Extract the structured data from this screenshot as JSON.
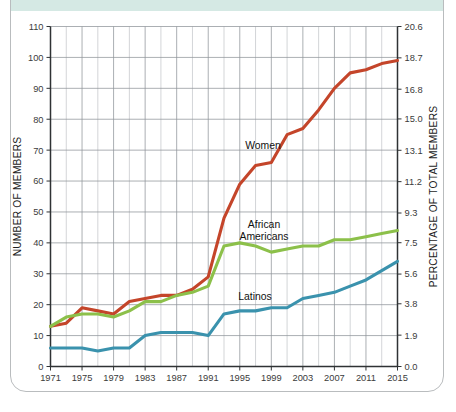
{
  "figure": {
    "frame_color": "#b9bcbe",
    "top_band_color": "#d5e9e4",
    "background_color": "#ffffff"
  },
  "chart_data": {
    "type": "line",
    "title": "",
    "subtitle": "",
    "xlabel": "",
    "ylabel": "NUMBER OF MEMBERS",
    "y2label": "PERCENTAGE OF TOTAL MEMBERS",
    "grid": true,
    "legend_position": "inline-annotations",
    "xlim": [
      1971,
      2015
    ],
    "ylim": [
      0,
      110
    ],
    "y2lim": [
      0.0,
      20.6
    ],
    "x_tick_labels": [
      "1971",
      "1975",
      "1979",
      "1983",
      "1987",
      "1991",
      "1995",
      "1999",
      "2003",
      "2007",
      "2011",
      "2015"
    ],
    "x_tick_values": [
      1971,
      1975,
      1979,
      1983,
      1987,
      1991,
      1995,
      1999,
      2003,
      2007,
      2011,
      2015
    ],
    "x_gridline_values": [
      1971,
      1973,
      1975,
      1977,
      1979,
      1981,
      1983,
      1985,
      1987,
      1989,
      1991,
      1993,
      1995,
      1997,
      1999,
      2001,
      2003,
      2005,
      2007,
      2009,
      2011,
      2013,
      2015
    ],
    "y_tick_labels": [
      "0",
      "10",
      "20",
      "30",
      "40",
      "50",
      "60",
      "70",
      "80",
      "90",
      "100",
      "110"
    ],
    "y_tick_values": [
      0,
      10,
      20,
      30,
      40,
      50,
      60,
      70,
      80,
      90,
      100,
      110
    ],
    "y2_tick_labels": [
      "0.0",
      "1.9",
      "3.8",
      "5.6",
      "7.5",
      "9.3",
      "11.2",
      "13.1",
      "15.0",
      "16.8",
      "18.7",
      "20.6"
    ],
    "y2_tick_values": [
      0.0,
      1.9,
      3.8,
      5.6,
      7.5,
      9.3,
      11.2,
      13.1,
      15.0,
      16.8,
      18.7,
      20.6
    ],
    "x": [
      1971,
      1973,
      1975,
      1977,
      1979,
      1981,
      1983,
      1985,
      1987,
      1989,
      1991,
      1993,
      1995,
      1997,
      1999,
      2001,
      2003,
      2005,
      2007,
      2009,
      2011,
      2013,
      2015
    ],
    "series": [
      {
        "name": "Women",
        "label": "Women",
        "color": "#c4452a",
        "values": [
          13,
          14,
          19,
          18,
          17,
          21,
          22,
          23,
          23,
          25,
          29,
          48,
          59,
          65,
          66,
          75,
          77,
          83,
          90,
          95,
          96,
          98,
          99
        ],
        "label_x": 2000,
        "label_y": 74
      },
      {
        "name": "African Americans",
        "label": "African Americans",
        "color": "#8cc04a",
        "values": [
          13,
          16,
          17,
          17,
          16,
          18,
          21,
          21,
          23,
          24,
          26,
          39,
          40,
          39,
          37,
          38,
          39,
          39,
          41,
          41,
          42,
          43,
          44
        ],
        "label_x": 1997,
        "label_y": 47
      },
      {
        "name": "Latinos",
        "label": "Latinos",
        "color": "#3a92ad",
        "values": [
          6,
          6,
          6,
          5,
          6,
          6,
          10,
          11,
          11,
          11,
          10,
          17,
          18,
          18,
          19,
          19,
          22,
          23,
          24,
          26,
          28,
          31,
          34
        ]
      }
    ],
    "annotations": [
      {
        "text": "Women",
        "series": "Women"
      },
      {
        "text": "African Americans",
        "series": "African Americans"
      },
      {
        "text": "Latinos",
        "series": "Latinos"
      }
    ]
  }
}
